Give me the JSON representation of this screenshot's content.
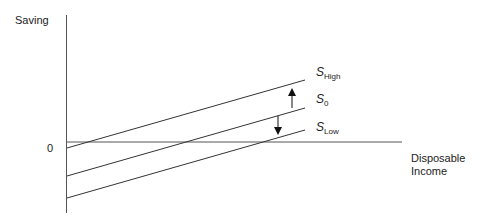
{
  "diagram": {
    "y_axis_label": "Saving",
    "x_axis_label_line1": "Disposable",
    "x_axis_label_line2": "Income",
    "origin_label": "0",
    "lines": [
      {
        "name": "S",
        "sub": "High"
      },
      {
        "name": "S",
        "sub": "0"
      },
      {
        "name": "S",
        "sub": "Low"
      }
    ],
    "arrows": [
      {
        "direction": "up",
        "from": "S0",
        "to": "SHigh"
      },
      {
        "direction": "down",
        "from": "S0",
        "to": "SLow"
      }
    ]
  }
}
